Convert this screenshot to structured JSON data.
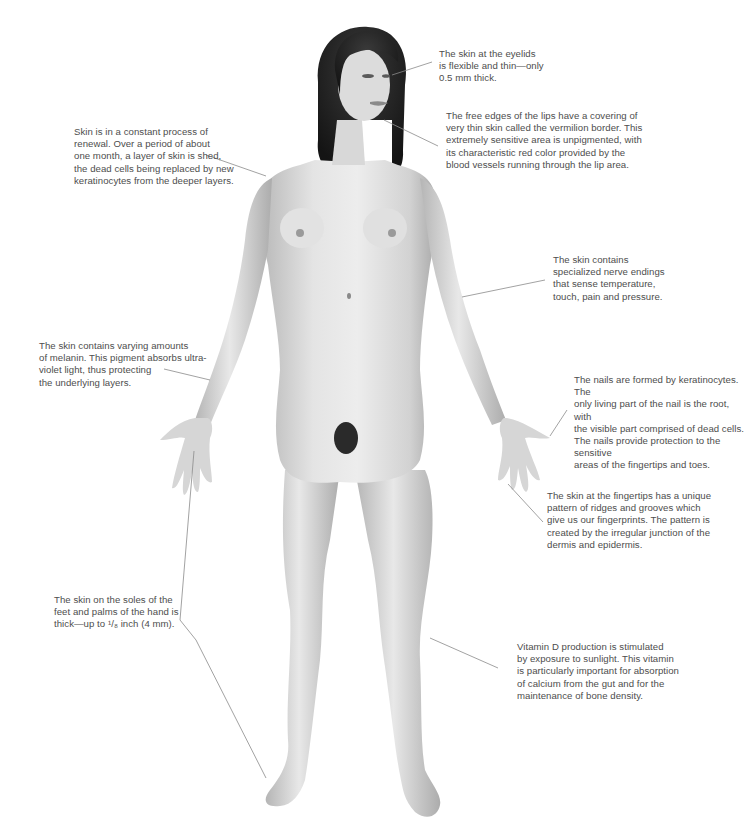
{
  "diagram": {
    "annotations": [
      {
        "id": "eyelids",
        "text": "The skin at the eyelids\nis flexible and thin—only\n0.5 mm thick."
      },
      {
        "id": "lips",
        "text": "The free edges of the lips have a covering of\nvery thin skin called the vermilion border. This\nextremely sensitive area is unpigmented, with\nits characteristic red color provided by the\nblood vessels running through the lip area."
      },
      {
        "id": "renewal",
        "text": "Skin is in a constant process of\nrenewal. Over a period of about\none month, a layer of skin is shed,\nthe dead cells being replaced by new\nkeratinocytes from the deeper layers."
      },
      {
        "id": "nerve-endings",
        "text": "The skin contains\nspecialized nerve endings\nthat sense temperature,\ntouch, pain and pressure."
      },
      {
        "id": "melanin",
        "text": "The skin contains varying amounts\nof melanin. This pigment absorbs ultra-\nviolet light, thus protecting\nthe underlying layers."
      },
      {
        "id": "nails",
        "text": "The nails are formed by keratinocytes. The\nonly living part of the nail is the root, with\nthe visible part comprised of dead cells.\nThe nails provide protection to the sensitive\nareas of the fingertips and toes."
      },
      {
        "id": "fingertips",
        "text": "The skin at the fingertips has a unique\npattern of ridges and grooves which\ngive us our fingerprints. The pattern is\ncreated by the irregular junction of the\ndermis and epidermis."
      },
      {
        "id": "soles-palms",
        "text": "The skin on the soles of the\nfeet and palms of the hand is\nthick—up to ¹/₈ inch (4 mm)."
      },
      {
        "id": "vitamin-d",
        "text": "Vitamin D production is stimulated\nby exposure to sunlight. This vitamin\nis particularly important for absorption\nof calcium from the gut and for the\nmaintenance of bone density."
      }
    ],
    "colors": {
      "background": "#ffffff",
      "text": "#4d4d4d",
      "leader_line": "#8a8a8a",
      "skin_light": "#e6e6e6",
      "skin_mid": "#cfcfcf",
      "skin_shadow": "#a8a8a8",
      "hair": "#1e1e1e"
    }
  }
}
